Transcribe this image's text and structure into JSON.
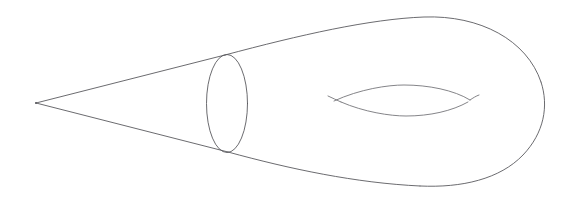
{
  "figure": {
    "kind": "line-drawing",
    "background_color": "#ffffff",
    "stroke_color": "#5a5a5f",
    "stroke_width": 0.9,
    "canvas": {
      "width": 573,
      "height": 202
    },
    "parts": [
      {
        "name": "cone-apex",
        "label": "apex",
        "type": "point",
        "x": 36,
        "y": 103
      },
      {
        "name": "cone-upper-edge",
        "label": "upper ruling of the cone",
        "type": "line",
        "path": "M 36 103 L 225 55"
      },
      {
        "name": "cone-lower-edge",
        "label": "lower ruling of the cone",
        "type": "line",
        "path": "M 36 103 L 228 152"
      },
      {
        "name": "neck-ellipse",
        "label": "circular cross-section at the neck",
        "type": "ellipse",
        "cx": 227,
        "cy": 103.5,
        "rx": 20.5,
        "ry": 49
      },
      {
        "name": "body-upper-outline",
        "label": "upper silhouette of the torus body",
        "type": "curve",
        "path": "M 225 55 C 300 35 370 19 424 17 C 480 15 527 40 541 82"
      },
      {
        "name": "body-right-outline",
        "label": "right end cap of the torus body",
        "type": "curve",
        "path": "M 541 82 C 549 106 544 133 523 155 C 500 179 462 188 420 186"
      },
      {
        "name": "body-lower-outline",
        "label": "lower silhouette of the torus body",
        "type": "curve",
        "path": "M 228 152 C 290 169 356 183 420 186"
      },
      {
        "name": "hole-upper-arc",
        "label": "far rim of the central hole",
        "type": "curve",
        "path": "M 334 101 C 360 89 388 85 404 85 C 428 85 454 90 470 100"
      },
      {
        "name": "hole-lower-arc",
        "label": "near rim of the central hole",
        "type": "curve",
        "path": "M 341 102 C 364 112 390 116 406 116 C 430 116 452 111 468 102"
      },
      {
        "name": "hole-left-hook",
        "label": "left hook of the central hole",
        "type": "curve",
        "path": "M 328 96 C 332 98 337 100 341 102"
      },
      {
        "name": "hole-right-hook",
        "label": "right hook of the central hole",
        "type": "curve",
        "path": "M 470 100 C 473 98 476 96 479 95"
      }
    ]
  }
}
